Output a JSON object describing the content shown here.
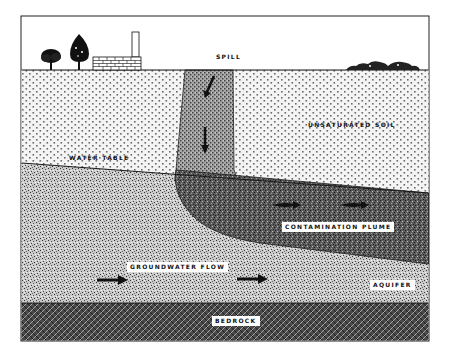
{
  "diagram": {
    "labels": {
      "spill": "SPILL",
      "unsaturated_soil": "UNSATURATED SOIL",
      "water_table": "WATER TABLE",
      "contamination_plume": "CONTAMINATION PLUME",
      "groundwater_flow": "GROUNDWATER FLOW",
      "aquifer": "AQUIFER",
      "bedrock": "BEDROCK"
    },
    "surface_features": [
      "tree",
      "tree",
      "brick-building-with-chimney",
      "shrubs"
    ],
    "arrows": {
      "spill_direction": "downward",
      "plume_flow": "rightward",
      "groundwater_flow": "rightward"
    },
    "colors": {
      "background": "#ffffff",
      "ink": "#111111",
      "unsaturated_soil_fill": "#e6e6e6",
      "spill_column_fill": "#9a9a9a",
      "aquifer_fill": "#bdbdbd",
      "plume_fill": "#5a5a5a",
      "bedrock_fill": "#3a3a3a"
    }
  }
}
